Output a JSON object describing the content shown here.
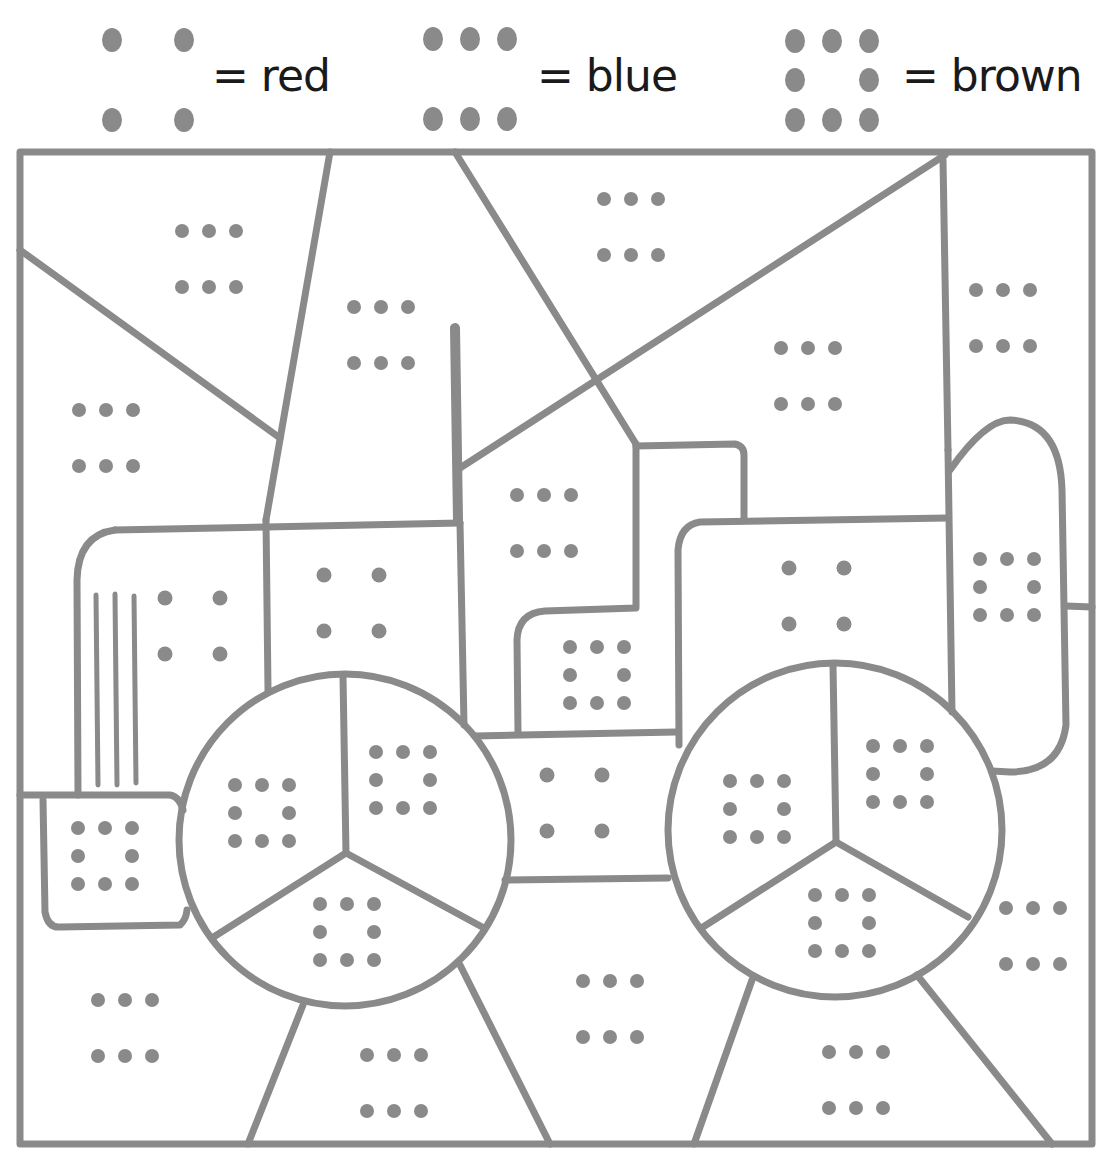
{
  "worksheet": {
    "type": "color-by-dot-pattern",
    "line_color": "#8a8a8a",
    "dot_color": "#8a8a8a"
  },
  "legend": [
    {
      "pattern": "four-corners",
      "dot_count": 4,
      "label": "= red",
      "color": "#d9302c"
    },
    {
      "pattern": "two-rows-of-three",
      "dot_count": 6,
      "label": "= blue",
      "color": "#2e62c9"
    },
    {
      "pattern": "square-ring",
      "dot_count": 8,
      "label": "= brown",
      "color": "#8b5a2b"
    }
  ],
  "regions": [
    {
      "id": "sky-top-left",
      "pattern": "two-rows-of-three",
      "color_key": "blue"
    },
    {
      "id": "sky-left",
      "pattern": "two-rows-of-three",
      "color_key": "blue"
    },
    {
      "id": "sky-center-left",
      "pattern": "two-rows-of-three",
      "color_key": "blue"
    },
    {
      "id": "sky-top-center",
      "pattern": "two-rows-of-three",
      "color_key": "blue"
    },
    {
      "id": "sky-center-right",
      "pattern": "two-rows-of-three",
      "color_key": "blue"
    },
    {
      "id": "sky-right",
      "pattern": "two-rows-of-three",
      "color_key": "blue"
    },
    {
      "id": "building-middle",
      "pattern": "two-rows-of-three",
      "color_key": "blue"
    },
    {
      "id": "cab-front",
      "pattern": "four-corners",
      "color_key": "red"
    },
    {
      "id": "cab-body",
      "pattern": "four-corners",
      "color_key": "red"
    },
    {
      "id": "tractor-body-right",
      "pattern": "four-corners",
      "color_key": "red"
    },
    {
      "id": "tractor-middle",
      "pattern": "four-corners",
      "color_key": "red"
    },
    {
      "id": "building-step",
      "pattern": "square-ring",
      "color_key": "brown"
    },
    {
      "id": "front-bumper",
      "pattern": "square-ring",
      "color_key": "brown"
    },
    {
      "id": "exhaust-pipe",
      "pattern": "square-ring",
      "color_key": "brown"
    },
    {
      "id": "wheel-left-a",
      "pattern": "square-ring",
      "color_key": "brown"
    },
    {
      "id": "wheel-left-b",
      "pattern": "square-ring",
      "color_key": "brown"
    },
    {
      "id": "wheel-left-c",
      "pattern": "square-ring",
      "color_key": "brown"
    },
    {
      "id": "wheel-right-a",
      "pattern": "square-ring",
      "color_key": "brown"
    },
    {
      "id": "wheel-right-b",
      "pattern": "square-ring",
      "color_key": "brown"
    },
    {
      "id": "wheel-right-c",
      "pattern": "square-ring",
      "color_key": "brown"
    },
    {
      "id": "ground-left",
      "pattern": "two-rows-of-three",
      "color_key": "blue"
    },
    {
      "id": "ground-center-left",
      "pattern": "two-rows-of-three",
      "color_key": "blue"
    },
    {
      "id": "ground-center",
      "pattern": "two-rows-of-three",
      "color_key": "blue"
    },
    {
      "id": "ground-center-right",
      "pattern": "two-rows-of-three",
      "color_key": "blue"
    },
    {
      "id": "ground-right",
      "pattern": "two-rows-of-three",
      "color_key": "blue"
    }
  ]
}
